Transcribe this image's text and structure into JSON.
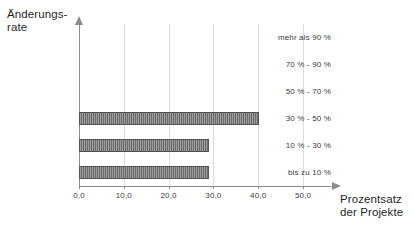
{
  "chart_data": {
    "type": "bar",
    "orientation": "horizontal",
    "title": "",
    "xlabel": "Prozentsatz\nder Projekte",
    "ylabel": "Änderungs-\nrate",
    "categories": [
      "mehr als 90 %",
      "70 % - 90 %",
      "50 % - 70 %",
      "30 % - 50 %",
      "10 % - 30 %",
      "bis zu 10 %"
    ],
    "values": [
      0,
      0,
      0,
      40.2,
      29.1,
      29.1
    ],
    "xlim": [
      0,
      55
    ],
    "xticks": [
      0,
      10,
      20,
      30,
      40,
      50
    ],
    "xtick_labels": [
      "0,0",
      "10,0",
      "20,0",
      "30,0",
      "40,0",
      "50,0"
    ],
    "grid": "vertical",
    "legend": "none",
    "bar_color": "#6d6d6d",
    "bar_edge_color": "#555555",
    "gridline_color": "#dcdcdc",
    "axis_color": "#8c8c8c"
  }
}
